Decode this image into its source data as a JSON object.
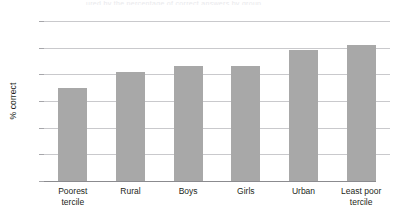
{
  "figure": {
    "caption_sliver": "ured by the percentage of correct answers by group",
    "background_color": "#ffffff"
  },
  "chart_data": {
    "type": "bar",
    "title": "",
    "xlabel": "",
    "ylabel": "% correct",
    "categories": [
      "Poorest tercile",
      "Rural",
      "Boys",
      "Girls",
      "Urban",
      "Least poor tercile"
    ],
    "category_lines": [
      [
        "Poorest",
        "tercile"
      ],
      [
        "Rural"
      ],
      [
        "Boys"
      ],
      [
        "Girls"
      ],
      [
        "Urban"
      ],
      [
        "Least poor",
        "tercile"
      ]
    ],
    "values": [
      35,
      41,
      43,
      43,
      49,
      51
    ],
    "ylim": [
      0,
      60
    ],
    "yticks": [
      0,
      10,
      20,
      30,
      40,
      50,
      60
    ],
    "ytick_labels": [
      "0",
      "10",
      "20",
      "30",
      "40",
      "50",
      "60"
    ],
    "grid": true,
    "grid_axis": "y",
    "legend": "none",
    "bar_color": "#a8a8a8",
    "grid_color": "#c9c9cc",
    "axis_color": "#8b8b8f",
    "text_color": "#231f20"
  }
}
